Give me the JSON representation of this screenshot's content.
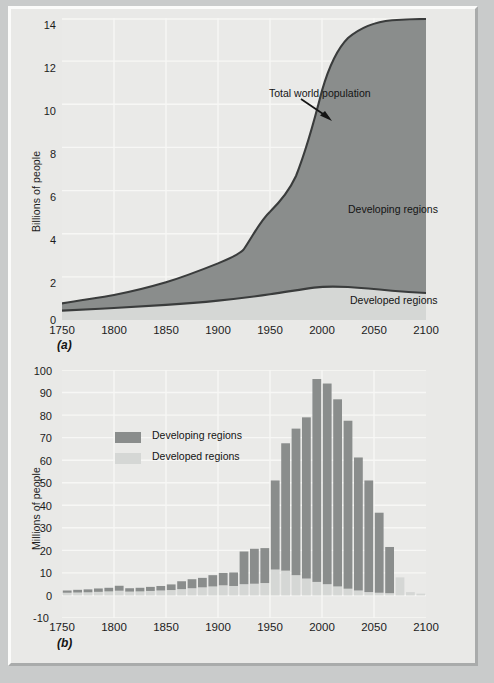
{
  "figure": {
    "background_color": "#c9cbcb",
    "panel_color": "#e9e9e7",
    "plot_color": "#eaeae8",
    "developing_color": "#8a8d8c",
    "developed_color": "#d5d7d5",
    "line_color": "#3a3c3c",
    "gridline_color": "#f4f4f2"
  },
  "panel_a": {
    "id_label": "(a)",
    "ylabel": "Billions of people",
    "yticks": [
      "0",
      "2",
      "4",
      "6",
      "8",
      "10",
      "12",
      "14"
    ],
    "ytick_values": [
      0,
      2,
      4,
      6,
      8,
      10,
      12,
      14
    ],
    "xticks": [
      "1750",
      "1800",
      "1850",
      "1900",
      "1950",
      "2000",
      "2050",
      "2100"
    ],
    "xtick_values": [
      1750,
      1800,
      1850,
      1900,
      1950,
      2000,
      2050,
      2100
    ],
    "annotation": "Total world population",
    "label_developing": "Developing regions",
    "label_developed": "Developed regions"
  },
  "panel_b": {
    "id_label": "(b)",
    "ylabel": "Millions of people",
    "yticks": [
      "-10",
      "0",
      "10",
      "20",
      "30",
      "40",
      "50",
      "60",
      "70",
      "80",
      "90",
      "100"
    ],
    "ytick_values": [
      -10,
      0,
      10,
      20,
      30,
      40,
      50,
      60,
      70,
      80,
      90,
      100
    ],
    "xticks": [
      "1750",
      "1800",
      "1850",
      "1900",
      "1950",
      "2000",
      "2050",
      "2100"
    ],
    "xtick_values": [
      1750,
      1800,
      1850,
      1900,
      1950,
      2000,
      2050,
      2100
    ],
    "legend": [
      {
        "label": "Developing regions",
        "color": "#8a8d8c"
      },
      {
        "label": "Developed regions",
        "color": "#d5d7d5"
      }
    ]
  },
  "chart_data": [
    {
      "type": "area",
      "panel": "(a)",
      "title": "",
      "xlabel": "",
      "ylabel": "Billions of people",
      "xlim": [
        1750,
        2100
      ],
      "ylim": [
        0,
        14
      ],
      "grid": true,
      "annotations": [
        {
          "text": "Total world population",
          "x": 2010,
          "y": 11.4
        },
        {
          "text": "Developing regions",
          "x": 2035,
          "y": 5.1
        },
        {
          "text": "Developed regions",
          "x": 2035,
          "y": 1.0
        }
      ],
      "x": [
        1750,
        1800,
        1850,
        1900,
        1925,
        1950,
        1975,
        2000,
        2025,
        2050,
        2075,
        2100
      ],
      "series": [
        {
          "name": "Developed regions",
          "color": "#d5d7d5",
          "values": [
            0.17,
            0.23,
            0.32,
            0.45,
            0.55,
            0.75,
            1.05,
            1.2,
            1.35,
            1.4,
            1.35,
            1.25
          ]
        },
        {
          "name": "Developing regions",
          "color": "#8a8d8c",
          "values": [
            0.6,
            0.7,
            0.87,
            1.15,
            1.4,
            1.95,
            2.9,
            4.8,
            7.5,
            9.05,
            9.3,
            9.4
          ]
        },
        {
          "name": "Total world population",
          "color": "#3a3c3c",
          "values": [
            0.77,
            0.93,
            1.19,
            1.6,
            1.95,
            2.7,
            3.95,
            6.0,
            8.85,
            10.45,
            10.65,
            10.65
          ]
        }
      ]
    },
    {
      "type": "bar",
      "panel": "(b)",
      "title": "",
      "xlabel": "",
      "ylabel": "Millions of people",
      "stacked": true,
      "xlim": [
        1750,
        2100
      ],
      "ylim": [
        -10,
        100
      ],
      "grid": true,
      "categories": [
        1750,
        1760,
        1770,
        1780,
        1790,
        1800,
        1810,
        1820,
        1830,
        1840,
        1850,
        1860,
        1870,
        1880,
        1890,
        1900,
        1910,
        1920,
        1930,
        1940,
        1950,
        1960,
        1970,
        1980,
        1990,
        2000,
        2010,
        2020,
        2030,
        2040,
        2050,
        2060,
        2070,
        2080,
        2090
      ],
      "series": [
        {
          "name": "Developed regions",
          "color": "#d5d7d5",
          "values": [
            1.2,
            1.3,
            1.4,
            1.6,
            1.8,
            2.1,
            1.7,
            1.8,
            2.0,
            2.2,
            2.4,
            2.8,
            3.2,
            3.6,
            4.0,
            4.5,
            4.2,
            5.0,
            5.2,
            5.5,
            11.5,
            11.0,
            9.0,
            7.5,
            6.0,
            5.0,
            4.0,
            3.0,
            2.2,
            1.5,
            1.2,
            1.0,
            8.0,
            1.5,
            0.8
          ]
        },
        {
          "name": "Developing regions",
          "color": "#8a8d8c",
          "values": [
            1.0,
            1.2,
            1.3,
            1.5,
            1.6,
            2.2,
            1.5,
            1.6,
            1.8,
            2.0,
            2.5,
            3.5,
            4.0,
            4.2,
            5.0,
            5.5,
            6.0,
            14.5,
            15.5,
            15.5,
            39.5,
            56.5,
            65.0,
            71.5,
            90.0,
            89.0,
            83.0,
            74.5,
            59.0,
            49.5,
            35.5,
            20.5,
            0.0,
            0.0,
            0.0
          ]
        }
      ],
      "stack_totals": [
        2.2,
        2.5,
        2.7,
        3.1,
        3.4,
        4.3,
        3.2,
        3.4,
        3.8,
        4.2,
        4.9,
        6.3,
        7.2,
        7.8,
        9.0,
        10.0,
        10.2,
        19.5,
        20.7,
        21.0,
        51.0,
        67.5,
        74.0,
        79.0,
        96.0,
        94.0,
        87.0,
        77.5,
        61.2,
        51.0,
        36.7,
        21.5,
        8.0,
        1.5,
        0.8
      ]
    }
  ]
}
